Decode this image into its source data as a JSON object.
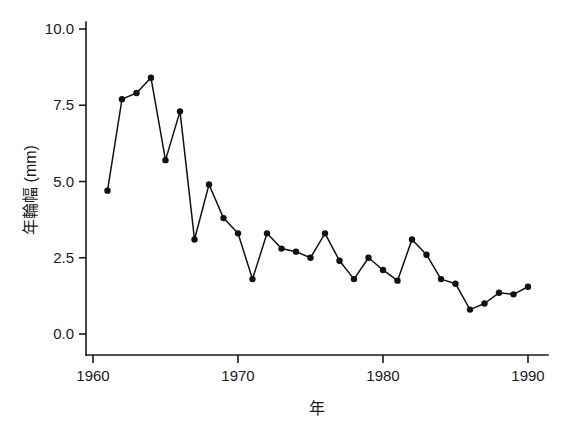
{
  "chart_data": {
    "type": "line",
    "title": "",
    "subtitle": "",
    "xlabel": "年",
    "ylabel": "年輪幅 (mm)",
    "xlim": [
      1959.5,
      1991.0
    ],
    "ylim": [
      0.0,
      10.4
    ],
    "grid": false,
    "legend": null,
    "legend_position": "none",
    "marker": "filled-circle",
    "x_ticks": [
      1960,
      1970,
      1980,
      1990
    ],
    "x_tick_labels": [
      "1960",
      "1970",
      "1980",
      "1990"
    ],
    "y_ticks": [
      0.0,
      2.5,
      5.0,
      7.5,
      10.0
    ],
    "y_tick_labels": [
      "0.0",
      "2.5",
      "5.0",
      "7.5",
      "10.0"
    ],
    "x": [
      1961,
      1962,
      1963,
      1964,
      1965,
      1966,
      1967,
      1968,
      1969,
      1970,
      1971,
      1972,
      1973,
      1974,
      1975,
      1976,
      1977,
      1978,
      1979,
      1980,
      1981,
      1982,
      1983,
      1984,
      1985,
      1986,
      1987,
      1988,
      1989,
      1990
    ],
    "values": [
      4.7,
      7.7,
      7.9,
      8.4,
      5.7,
      7.3,
      3.1,
      4.9,
      3.8,
      3.3,
      1.8,
      3.3,
      2.8,
      2.7,
      2.5,
      3.3,
      2.4,
      1.8,
      2.5,
      2.1,
      1.75,
      3.1,
      2.6,
      1.8,
      1.65,
      0.8,
      1.0,
      1.35,
      1.3,
      1.55
    ],
    "series": [
      {
        "name": "年輪幅",
        "color": "#111111",
        "values": [
          4.7,
          7.7,
          7.9,
          8.4,
          5.7,
          7.3,
          3.1,
          4.9,
          3.8,
          3.3,
          1.8,
          3.3,
          2.8,
          2.7,
          2.5,
          3.3,
          2.4,
          1.8,
          2.5,
          2.1,
          1.75,
          3.1,
          2.6,
          1.8,
          1.65,
          0.8,
          1.0,
          1.35,
          1.3,
          1.55
        ]
      }
    ],
    "colors": {
      "line": "#111111",
      "marker": "#111111",
      "axis": "#1a1a1a",
      "background": "#ffffff"
    }
  }
}
